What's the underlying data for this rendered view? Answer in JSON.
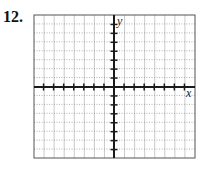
{
  "problem": {
    "number": "12."
  },
  "graph": {
    "x_label": "x",
    "y_label": "y",
    "grid": {
      "columns": 16,
      "rows": 16,
      "x_min": -8,
      "x_max": 8,
      "y_min": -8,
      "y_max": 8
    },
    "ticks": {
      "x_count_each_side": 7,
      "y_count_each_side": 7
    },
    "colors": {
      "axis": "#1a1a1a",
      "grid_vertical": "#bdbdbd",
      "grid_horizontal": "#9a9a9a",
      "border": "#555555"
    }
  }
}
